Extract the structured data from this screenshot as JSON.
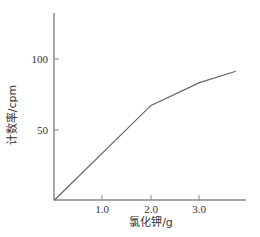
{
  "chart_data": {
    "type": "line",
    "title": "",
    "xlabel": "氯化钾/g",
    "ylabel": "计数率/cpm",
    "x_ticks": [
      "1.0",
      "2.0",
      "3.0"
    ],
    "y_ticks": [
      "50",
      "100"
    ],
    "xlim": [
      0,
      4.0
    ],
    "ylim": [
      0,
      132
    ],
    "grid": false,
    "legend": null,
    "series": [
      {
        "name": "计数率",
        "x": [
          0,
          2.0,
          3.0,
          3.75
        ],
        "y": [
          0,
          67,
          83,
          91
        ]
      }
    ]
  },
  "colors": {
    "axis": "#888888",
    "line": "#666666",
    "text": "#333333"
  }
}
